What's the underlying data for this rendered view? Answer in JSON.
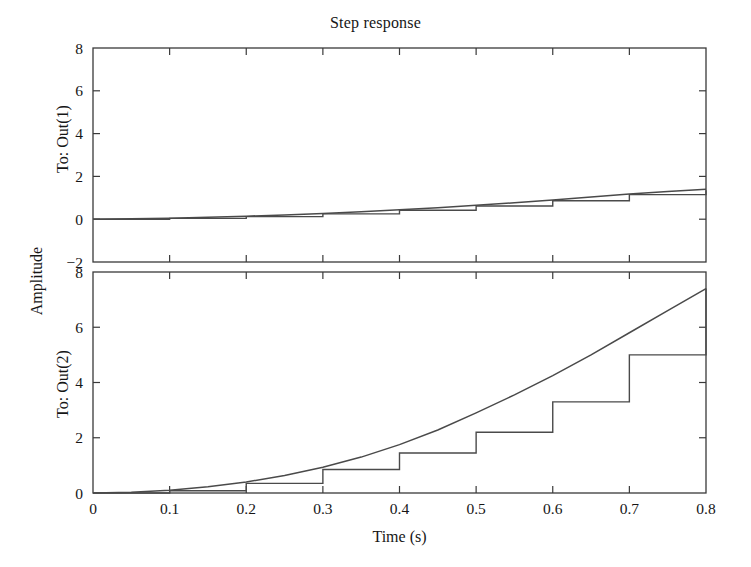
{
  "figure": {
    "title": "Step response",
    "xlabel": "Time (s)",
    "ylabel": "Amplitude",
    "background": "#ffffff",
    "line_color": "#4a4a4a",
    "axis_color": "#3a3a3a"
  },
  "subplots": {
    "top": {
      "row_label": "To: Out(1)"
    },
    "bottom": {
      "row_label": "To: Out(2)"
    }
  },
  "ticks": {
    "x": [
      "0",
      "0.1",
      "0.2",
      "0.3",
      "0.4",
      "0.5",
      "0.6",
      "0.7",
      "0.8"
    ],
    "y_top": [
      "8",
      "6",
      "4",
      "2",
      "0",
      "-2"
    ],
    "y_bottom": [
      "8",
      "6",
      "4",
      "2",
      "0"
    ]
  },
  "chart_data": {
    "type": "line",
    "title": "Step response",
    "xlabel": "Time (s)",
    "ylabel": "Amplitude",
    "grid": false,
    "legend": null,
    "layout": "2 rows x 1 column, shared x-axis",
    "xlim": [
      0,
      0.8
    ],
    "xticks": [
      0,
      0.1,
      0.2,
      0.3,
      0.4,
      0.5,
      0.6,
      0.7,
      0.8
    ],
    "panels": [
      {
        "name": "To: Out(1)",
        "ylim": [
          -2,
          8
        ],
        "yticks": [
          -2,
          0,
          2,
          4,
          6,
          8
        ],
        "series": [
          {
            "name": "continuous response",
            "style": "solid",
            "x": [
              0,
              0.05,
              0.1,
              0.15,
              0.2,
              0.25,
              0.3,
              0.35,
              0.4,
              0.45,
              0.5,
              0.55,
              0.6,
              0.65,
              0.7,
              0.75,
              0.8
            ],
            "y": [
              0,
              0.02,
              0.05,
              0.09,
              0.14,
              0.2,
              0.27,
              0.35,
              0.44,
              0.54,
              0.65,
              0.77,
              0.9,
              1.04,
              1.18,
              1.3,
              1.4
            ]
          },
          {
            "name": "discrete (zero-order hold) response",
            "style": "staircase",
            "x": [
              0,
              0.1,
              0.2,
              0.3,
              0.4,
              0.5,
              0.6,
              0.7,
              0.8
            ],
            "y": [
              0,
              0.04,
              0.12,
              0.25,
              0.42,
              0.62,
              0.86,
              1.15,
              1.35
            ]
          }
        ]
      },
      {
        "name": "To: Out(2)",
        "ylim": [
          0,
          8
        ],
        "yticks": [
          0,
          2,
          4,
          6,
          8
        ],
        "series": [
          {
            "name": "continuous response",
            "style": "solid",
            "x": [
              0,
              0.05,
              0.1,
              0.15,
              0.2,
              0.25,
              0.3,
              0.35,
              0.4,
              0.45,
              0.5,
              0.55,
              0.6,
              0.65,
              0.7,
              0.75,
              0.8
            ],
            "y": [
              0,
              0.03,
              0.1,
              0.23,
              0.4,
              0.63,
              0.93,
              1.3,
              1.75,
              2.28,
              2.9,
              3.55,
              4.25,
              5.0,
              5.8,
              6.6,
              7.4
            ]
          },
          {
            "name": "discrete (zero-order hold) response",
            "style": "staircase",
            "x": [
              0,
              0.1,
              0.2,
              0.3,
              0.4,
              0.5,
              0.6,
              0.7,
              0.8
            ],
            "y": [
              0,
              0.08,
              0.35,
              0.85,
              1.45,
              2.2,
              3.3,
              5.0,
              7.4
            ]
          }
        ]
      }
    ]
  }
}
